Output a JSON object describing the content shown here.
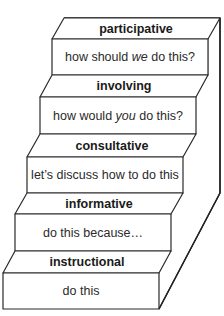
{
  "diagram": {
    "type": "staircase",
    "steps": [
      {
        "level": 5,
        "label": "participative",
        "desc_before": "how should ",
        "desc_em": "we",
        "desc_after": " do this?"
      },
      {
        "level": 4,
        "label": "involving",
        "desc_before": "how would ",
        "desc_em": "you",
        "desc_after": " do this?"
      },
      {
        "level": 3,
        "label": "consultative",
        "desc_before": "let’s discuss how to do this",
        "desc_em": "",
        "desc_after": ""
      },
      {
        "level": 2,
        "label": "informative",
        "desc_before": "do this because…",
        "desc_em": "",
        "desc_after": ""
      },
      {
        "level": 1,
        "label": "instructional",
        "desc_before": "do this",
        "desc_em": "",
        "desc_after": ""
      }
    ]
  }
}
